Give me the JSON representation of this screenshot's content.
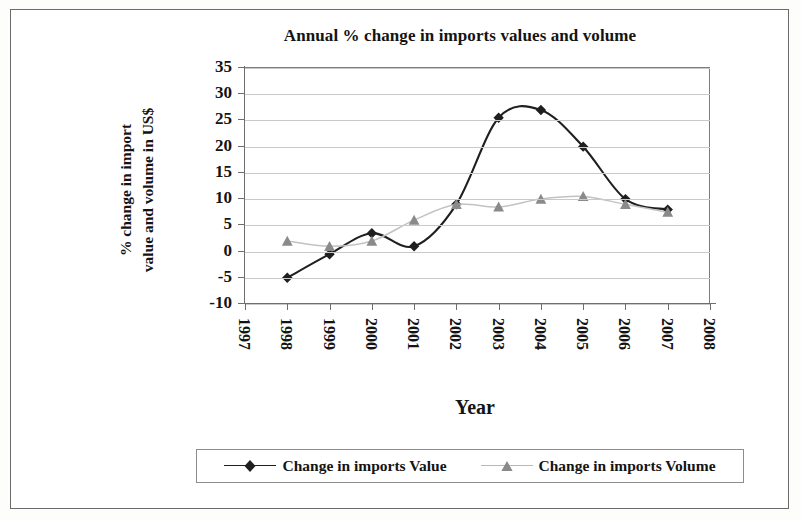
{
  "chart_data": {
    "type": "line",
    "title": "Annual % change in imports values and volume",
    "xlabel": "Year",
    "ylabel_lines": [
      "% change in import",
      "value and volume in US$"
    ],
    "x_tick_labels": [
      "1997",
      "1998",
      "1999",
      "2000",
      "2001",
      "2002",
      "2003",
      "2004",
      "2005",
      "2006",
      "2007",
      "2008"
    ],
    "y_tick_labels": [
      "35",
      "30",
      "25",
      "20",
      "15",
      "10",
      "5",
      "0",
      "-5",
      "-10"
    ],
    "ylim": [
      -10,
      35
    ],
    "ytick_step": 5,
    "grid": true,
    "legend_position": "bottom",
    "x": [
      1998,
      1999,
      2000,
      2001,
      2002,
      2003,
      2004,
      2005,
      2006,
      2007
    ],
    "series": [
      {
        "name": "Change in imports Value",
        "marker": "diamond",
        "color": "#1f1f1f",
        "values": [
          -5,
          -0.5,
          3.5,
          1,
          9,
          25.5,
          27,
          20,
          10,
          8
        ]
      },
      {
        "name": "Change in imports Volume",
        "marker": "triangle",
        "color": "#8a8a8a",
        "values": [
          2,
          1,
          2,
          6,
          9,
          8.5,
          10,
          10.5,
          9,
          7.5
        ]
      }
    ]
  },
  "colors": {
    "value_series": "#1f1f1f",
    "volume_series": "#8a8a8a",
    "gridline": "#c9c9c9",
    "axis": "#6e6e6e",
    "frame": "#6b6b6b"
  }
}
